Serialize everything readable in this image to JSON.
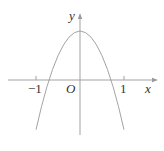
{
  "figure": {
    "type": "function-graph",
    "axes": {
      "x_label": "x",
      "y_label": "y",
      "origin_label": "O",
      "x_ticks": [
        {
          "value": -1,
          "label": "−1"
        },
        {
          "value": 1,
          "label": "1"
        }
      ]
    },
    "curve": {
      "shape": "parabola",
      "opens": "down",
      "vertex_approx": [
        0,
        1.1
      ],
      "x_intercepts_approx": [
        -0.7,
        0.7
      ],
      "x_range_drawn": [
        -1,
        1
      ]
    },
    "colors": {
      "axis": "#999999",
      "curve": "#999999",
      "text": "#333333"
    }
  }
}
